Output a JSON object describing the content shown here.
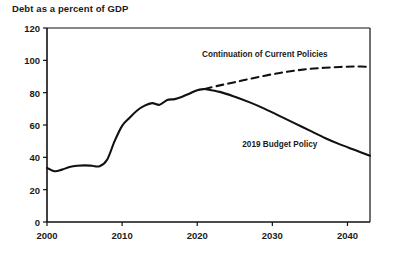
{
  "chart_data": {
    "type": "line",
    "title": "Debt as a percent of GDP",
    "xlabel": "",
    "ylabel": "",
    "xlim": [
      2000,
      2043
    ],
    "ylim": [
      0,
      120
    ],
    "yticks": [
      0,
      20,
      40,
      60,
      80,
      100,
      120
    ],
    "xticks": [
      2000,
      2010,
      2020,
      2030,
      2040
    ],
    "grid": false,
    "legend_position": "inline-annotations",
    "annotations": [
      {
        "text": "Continuation of Current Policies",
        "series": "Continuation of Current Policies",
        "x": 2029,
        "y": 104
      },
      {
        "text": "2019 Budget Policy",
        "series": "2019 Budget Policy",
        "x": 2031,
        "y": 48
      }
    ],
    "series": [
      {
        "name": "Historical",
        "style": "solid",
        "color": "#111111",
        "x": [
          2000,
          2001,
          2002,
          2003,
          2004,
          2005,
          2006,
          2007,
          2008,
          2009,
          2010,
          2011,
          2012,
          2013,
          2014,
          2015,
          2016,
          2017,
          2018,
          2019,
          2020,
          2021
        ],
        "values": [
          33.5,
          31.4,
          32.4,
          34.0,
          34.8,
          35.0,
          34.8,
          34.5,
          38.5,
          50.0,
          59.5,
          64.5,
          69.0,
          72.0,
          73.5,
          72.5,
          75.5,
          76.0,
          77.5,
          79.5,
          81.5,
          82.3
        ]
      },
      {
        "name": "Continuation of Current Policies",
        "style": "dashed",
        "color": "#111111",
        "x": [
          2021,
          2023,
          2025,
          2027,
          2029,
          2031,
          2033,
          2035,
          2037,
          2039,
          2041,
          2043
        ],
        "values": [
          82.3,
          84.5,
          86.5,
          88.5,
          90.5,
          92.2,
          93.6,
          94.7,
          95.4,
          95.9,
          96.2,
          96.0
        ]
      },
      {
        "name": "2019 Budget Policy",
        "style": "solid",
        "color": "#111111",
        "x": [
          2021,
          2023,
          2025,
          2027,
          2029,
          2031,
          2033,
          2035,
          2037,
          2039,
          2041,
          2043
        ],
        "values": [
          82.3,
          80.5,
          77.5,
          74.0,
          70.0,
          65.5,
          61.0,
          56.5,
          52.0,
          48.0,
          44.5,
          41.0
        ]
      }
    ]
  },
  "axis": {
    "ytick_labels": [
      "0",
      "20",
      "40",
      "60",
      "80",
      "100",
      "120"
    ],
    "xtick_labels": [
      "2000",
      "2010",
      "2020",
      "2030",
      "2040"
    ]
  }
}
